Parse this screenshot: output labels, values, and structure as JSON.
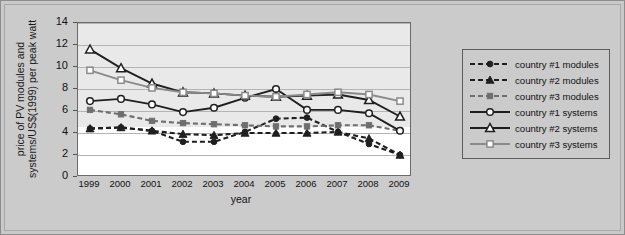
{
  "chart_data": {
    "type": "line",
    "title": "",
    "xlabel": "year",
    "ylabel_line1": "price of PV modules and",
    "ylabel_line2": "systems/US$(1999) per peak watt",
    "categories": [
      "1999",
      "2000",
      "2001",
      "2002",
      "2003",
      "2004",
      "2005",
      "2006",
      "2007",
      "2008",
      "2009"
    ],
    "x": [
      1999,
      2000,
      2001,
      2002,
      2003,
      2004,
      2005,
      2006,
      2007,
      2008,
      2009
    ],
    "ylim": [
      0,
      14
    ],
    "yticks": [
      0,
      2,
      4,
      6,
      8,
      10,
      12,
      14
    ],
    "grid": true,
    "legend_position": "right-outside",
    "series": [
      {
        "name": "country #1 modules",
        "marker": "circle-filled",
        "style": "dashed",
        "color": "#1f1f1f",
        "values": [
          4.4,
          4.5,
          4.2,
          3.2,
          3.2,
          4.1,
          5.3,
          5.4,
          4.1,
          3.0,
          2.0
        ]
      },
      {
        "name": "country #2 modules",
        "marker": "triangle-filled",
        "style": "dashed",
        "color": "#1f1f1f",
        "values": [
          4.4,
          4.5,
          4.2,
          3.9,
          3.8,
          4.0,
          4.0,
          4.0,
          4.1,
          3.5,
          2.0
        ]
      },
      {
        "name": "country #3 modules",
        "marker": "square-filled",
        "style": "dashed",
        "color": "#6e6e6e",
        "values": [
          6.1,
          5.7,
          5.1,
          4.9,
          4.8,
          4.7,
          4.6,
          4.6,
          4.7,
          4.7,
          4.2
        ]
      },
      {
        "name": "country #1 systems",
        "marker": "circle-open",
        "style": "solid",
        "color": "#1f1f1f",
        "values": [
          6.9,
          7.1,
          6.6,
          5.9,
          6.3,
          7.2,
          8.0,
          6.1,
          6.1,
          5.8,
          4.2
        ]
      },
      {
        "name": "country #2 systems",
        "marker": "triangle-open",
        "style": "solid",
        "color": "#1f1f1f",
        "values": [
          11.6,
          9.9,
          8.5,
          7.7,
          7.6,
          7.4,
          7.3,
          7.4,
          7.5,
          7.0,
          5.5
        ]
      },
      {
        "name": "country #3 systems",
        "marker": "square-open",
        "style": "solid",
        "color": "#8a8a8a",
        "values": [
          9.7,
          8.8,
          8.1,
          7.7,
          7.6,
          7.4,
          7.3,
          7.5,
          7.7,
          7.5,
          6.9
        ]
      }
    ]
  },
  "legend": {
    "items": [
      {
        "label": "country #1 modules"
      },
      {
        "label": "country #2 modules"
      },
      {
        "label": "country #3 modules"
      },
      {
        "label": "country #1 systems"
      },
      {
        "label": "country #2 systems"
      },
      {
        "label": "country #3 systems"
      }
    ]
  },
  "colors": {
    "figure_background": "#c9c9c9",
    "plot_background": "#ffffff",
    "plot_band": "#e9e9e9",
    "gridline": "#b4b4b4",
    "axis": "#6b6b6b",
    "dark_series": "#1f1f1f",
    "mid_gray_series": "#6e6e6e",
    "light_gray_series": "#8a8a8a"
  }
}
